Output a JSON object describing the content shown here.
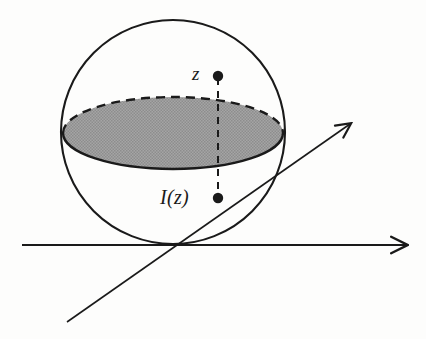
{
  "figure": {
    "background_color": "#fdfdfc",
    "stroke_color": "#1a1a1a",
    "shade_color": "#9a9a9a",
    "labels": {
      "point_top": "z",
      "point_bottom": "I(z)"
    },
    "geometry": {
      "sphere": {
        "cx": 173,
        "cy": 132,
        "r": 112
      },
      "disk": {
        "cx": 173,
        "cy": 133,
        "rx": 110,
        "ry": 36
      },
      "point_top_dot": {
        "x": 218,
        "y": 76,
        "r": 5
      },
      "point_bottom_dot": {
        "x": 218,
        "y": 198,
        "r": 5
      },
      "connector": {
        "x": 218,
        "y1": 76,
        "y2": 198,
        "style": "dashed"
      },
      "axis_horizontal": {
        "x1": 22,
        "y1": 245,
        "x2": 412,
        "y2": 245,
        "arrow": "end"
      },
      "axis_diagonal": {
        "x1": 67,
        "y1": 322,
        "x2": 355,
        "y2": 120,
        "arrow": "end"
      }
    }
  }
}
